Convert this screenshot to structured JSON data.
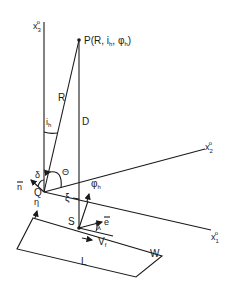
{
  "diagram": {
    "type": "geometry-coordinate-diagram",
    "labels": {
      "x3_axis": "x",
      "x3_sub": "3",
      "x2_axis": "x",
      "x2_sub": "2",
      "x1_axis": "x",
      "x1_sub": "1",
      "axis_sup": "o",
      "point_p": "P(R, i",
      "point_p_h": "h",
      "point_p_mid": ", φ",
      "point_p_h2": "h",
      "point_p_end": ")",
      "R": "R",
      "D": "D",
      "i": "i",
      "i_sub": "h",
      "theta": "Θ",
      "delta": "δ",
      "n_vec": "n",
      "Q": "Q",
      "xi": "ξ",
      "phi": "φ",
      "phi_sub": "h",
      "eta": "η",
      "S": "S",
      "e_vec": "e",
      "lambda": "λ",
      "V": "V",
      "V_sub": "f",
      "L": "L",
      "W": "W"
    },
    "colors": {
      "line": "#1a1a1a",
      "background": "#ffffff"
    }
  }
}
